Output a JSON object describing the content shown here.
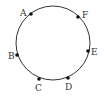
{
  "diagram": {
    "type": "circle-with-points",
    "circle": {
      "cx": 53,
      "cy": 43,
      "r": 37,
      "stroke": "#333333"
    },
    "points": [
      {
        "label": "A",
        "x": 31,
        "y": 14,
        "lx": 20,
        "ly": 16
      },
      {
        "label": "F",
        "x": 78,
        "y": 17,
        "lx": 82,
        "ly": 18
      },
      {
        "label": "E",
        "x": 88,
        "y": 51,
        "lx": 91,
        "ly": 55
      },
      {
        "label": "D",
        "x": 68,
        "y": 78,
        "lx": 65,
        "ly": 90
      },
      {
        "label": "C",
        "x": 39,
        "y": 79,
        "lx": 35,
        "ly": 91
      },
      {
        "label": "B",
        "x": 17,
        "y": 55,
        "lx": 8,
        "ly": 59
      }
    ]
  }
}
